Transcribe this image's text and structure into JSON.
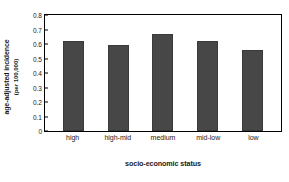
{
  "chart_data": {
    "type": "bar",
    "title": "",
    "categories": [
      "high",
      "high-mid",
      "medium",
      "mid-low",
      "low"
    ],
    "values": [
      0.62,
      0.59,
      0.67,
      0.62,
      0.56
    ],
    "series": [
      {
        "name": "age-adjusted incidence",
        "values": [
          0.62,
          0.59,
          0.67,
          0.62,
          0.56
        ]
      }
    ],
    "xlabel": "socio-economic status",
    "ylabel_line1": "age-adjusted incidence",
    "ylabel_line2": "(per 100,000)",
    "ylim": [
      0,
      0.8
    ],
    "ytick_labels": [
      "0",
      "0.1",
      "0.2",
      "0.3",
      "0.4",
      "0.5",
      "0.6",
      "0.7",
      "0.8"
    ],
    "ytick_values": [
      0,
      0.1,
      0.2,
      0.3,
      0.4,
      0.5,
      0.6,
      0.7,
      0.8
    ],
    "grid": false,
    "legend": "none",
    "bar_color": "#474747",
    "frame_color": "#000000",
    "background_color": "#ffffff"
  }
}
